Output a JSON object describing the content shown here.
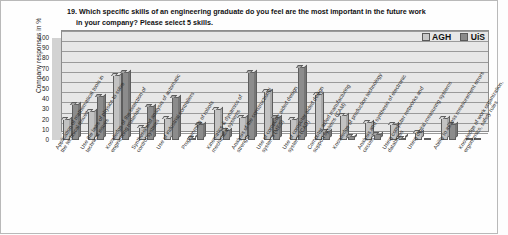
{
  "question": {
    "line1": "19. Which specific skills of an engineering graduate do you feel are the most important in the future work",
    "line2": "in your company?  Please select 5 skills."
  },
  "legend": {
    "series1": "AGH",
    "series2": "UiS"
  },
  "axis": {
    "y_title": "Company responses in %",
    "y_ticks": [
      "100",
      "90",
      "80",
      "70",
      "60",
      "50",
      "40",
      "30",
      "20",
      "10",
      "0"
    ]
  },
  "chart_data": {
    "type": "bar",
    "title": "19. Which specific skills of an engineering graduate do you feel are the most important in the future work in your company?  Please select 5 skills.",
    "xlabel": "",
    "ylabel": "Company responses in %",
    "ylim": [
      0,
      100
    ],
    "ytick_step": 10,
    "grid": true,
    "legend_position": "top-right",
    "categories": [
      "Application of mathematical tools in the technical issues",
      "Use the laws of physics to solve technical issues",
      "Knowledge of the selection of engineering materials",
      "Synthesis and analysis of automatic control systems",
      "Use of industrial controllers",
      "Programming of robots",
      "Kinematics & dynamics of mechanical systems",
      "Analysis of the constructional strength",
      "Use of computer aided design systems (MES)",
      "Use of computer aided design systems (CAD)",
      "Computer aided manufacturing support systems (CAM)",
      "Knowledge of production technology",
      "Analysis and synthesis of electronic circuits",
      "Using computer networks and databases",
      "Using digital measuring systems",
      "Ability to assess measurement errors",
      "Knowledge of work organization, ergonomics, safety rules"
    ],
    "series": [
      {
        "name": "AGH",
        "color": "#c2c2c2",
        "values": [
          21,
          28,
          64,
          13,
          22,
          2,
          30,
          23,
          48,
          21,
          45,
          25,
          18,
          16,
          8,
          22,
          0
        ]
      },
      {
        "name": "UiS",
        "color": "#8c8c8c",
        "values": [
          35,
          43,
          67,
          33,
          42,
          16,
          10,
          67,
          23,
          72,
          9,
          4,
          6,
          2,
          0,
          16,
          0
        ]
      }
    ]
  }
}
